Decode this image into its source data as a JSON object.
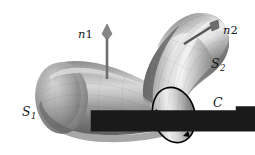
{
  "figure": {
    "kind": "stokes-theorem-surface-diagram",
    "background_color": "#ffffff",
    "ink_color": "#1a1a1a",
    "width": 255,
    "height": 155
  },
  "labels": {
    "s1": {
      "base": "S",
      "sub": "1"
    },
    "s2": {
      "base": "S",
      "sub": "2"
    },
    "c": {
      "base": "C"
    },
    "n1": {
      "base": "n",
      "sub": "1",
      "accent": "vector-arrow"
    },
    "n2": {
      "base": "n",
      "sub": "2",
      "accent": "vector-arrow"
    }
  },
  "surfaces": {
    "s1": {
      "name": "S1",
      "description": "lower-left curved tube lobe",
      "shading": "gray-cylindrical-gradient",
      "fill_light": "#e9e9e9",
      "fill_mid": "#9a9a9a",
      "fill_dark": "#5d5d5d"
    },
    "s2": {
      "name": "S2",
      "description": "upper-right curved tube lobe",
      "shading": "gray-cylindrical-gradient",
      "fill_light": "#f2f2f2",
      "fill_mid": "#a6a6a6",
      "fill_dark": "#565656"
    }
  },
  "curve_c": {
    "name": "C",
    "description": "oriented boundary circle between S1 and S2",
    "stroke_color": "#000000",
    "stroke_width": 1.6,
    "orientation": "counterclockwise",
    "arrow_count": 2
  },
  "normals": {
    "n1": {
      "label": "n1",
      "description": "normal vector on S1, pointing straight up",
      "shaft_color": "#6e6e6e",
      "head_color": "#808080",
      "direction": "up",
      "tail": [
        107,
        79
      ],
      "tip": [
        107,
        29
      ]
    },
    "n2": {
      "label": "n2",
      "description": "normal vector on S2, pointing up and to the right",
      "shaft_color": "#555555",
      "head_color": "#6a6a6a",
      "direction": "up-right",
      "tail": [
        185,
        42
      ],
      "tip": [
        216,
        22
      ]
    }
  }
}
